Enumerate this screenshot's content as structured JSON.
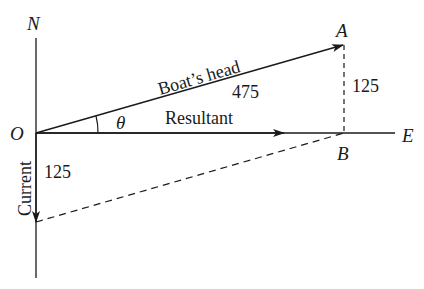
{
  "diagram": {
    "type": "vector-triangle",
    "axes": {
      "north_label": "N",
      "east_label": "E",
      "origin_label": "O"
    },
    "points": {
      "A": "A",
      "B": "B"
    },
    "vectors": {
      "boats_head": {
        "label": "Boat’s head",
        "magnitude": "475"
      },
      "resultant": {
        "label": "Resultant"
      },
      "current": {
        "label": "Current",
        "magnitude": "125"
      },
      "ab_side": {
        "magnitude": "125"
      }
    },
    "angle_label": "θ",
    "colors": {
      "line": "#1a1a1a",
      "background": "#ffffff"
    }
  }
}
